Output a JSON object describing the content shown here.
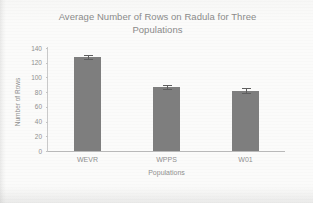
{
  "chart_data": {
    "type": "bar",
    "title": "Average Number of Rows on Radula for Three Populations",
    "title_line1": "Average Number of Rows on Radula for Three",
    "title_line2": "Populations",
    "xlabel": "Populations",
    "ylabel": "Number of Rows",
    "categories": [
      "WEVR",
      "WPPS",
      "W01"
    ],
    "values": [
      128,
      87,
      82
    ],
    "errors": [
      3,
      3,
      3
    ],
    "ylim": [
      0,
      140
    ],
    "yticks": [
      0,
      20,
      40,
      60,
      80,
      100,
      120,
      140
    ],
    "grid": false,
    "legend": false,
    "bar_color": "#7e7e7e",
    "error_color": "#5e5e5e",
    "text_color": "#8f8f8f",
    "background_color": "#fbfbfa"
  }
}
